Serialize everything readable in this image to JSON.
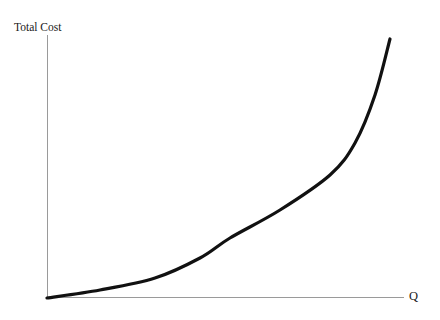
{
  "chart_data": {
    "type": "line",
    "title": "",
    "subtitle": "",
    "xlabel": "Q",
    "ylabel": "Total Cost",
    "x": [
      0,
      20,
      40,
      60,
      80,
      100,
      110,
      120,
      130,
      140,
      150,
      160,
      170,
      180,
      190,
      200
    ],
    "y": [
      0,
      2,
      5,
      9,
      15,
      23,
      28,
      34,
      41,
      49,
      59,
      71,
      85,
      103,
      126,
      158
    ],
    "series": [
      {
        "name": "Total Cost",
        "values": [
          0,
          2,
          5,
          9,
          15,
          23,
          28,
          34,
          41,
          49,
          59,
          71,
          85,
          103,
          126,
          158
        ]
      }
    ],
    "xlim": [
      0,
      200
    ],
    "ylim": [
      0,
      160
    ],
    "grid": false,
    "legend": false,
    "legend_position": "none",
    "xticks": [],
    "yticks": [],
    "annotations": [],
    "curve_color": "#111111",
    "axis_color": "#9a9a9a",
    "background_color": "#ffffff",
    "curve_width_px": 3.2,
    "axis_width_px": 1,
    "pixel_geometry": {
      "origin": [
        47,
        298
      ],
      "y_axis_top": [
        47,
        35
      ],
      "x_axis_right": [
        404,
        297
      ],
      "curve_end": [
        390,
        39
      ],
      "curve_samples": [
        [
          47,
          298
        ],
        [
          100,
          290
        ],
        [
          155,
          278
        ],
        [
          200,
          258
        ],
        [
          230,
          238
        ],
        [
          280,
          210
        ],
        [
          330,
          175
        ],
        [
          355,
          143
        ],
        [
          375,
          95
        ],
        [
          390,
          39
        ]
      ]
    }
  },
  "labels": {
    "y_axis": "Total Cost",
    "x_axis": "Q"
  }
}
